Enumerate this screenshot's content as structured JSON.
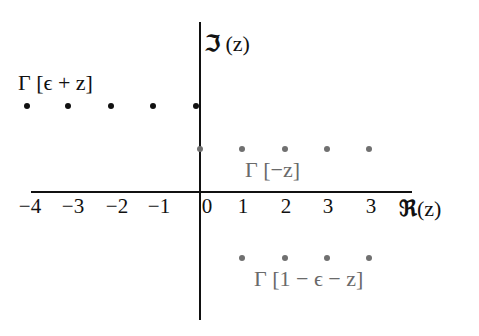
{
  "diagram": {
    "type": "complex-plane-pole-diagram",
    "axes": {
      "real_label_symbol": "ℜ",
      "real_label_arg": "(z)",
      "imag_label_symbol": "ℑ",
      "imag_label_arg": "(z)"
    },
    "ticks": {
      "negative": [
        "−4",
        "−3",
        "−2",
        "−1"
      ],
      "zero": "0",
      "positive": [
        "1",
        "2",
        "3",
        "3"
      ]
    },
    "series": [
      {
        "name": "Γ [ϵ + z]",
        "color": "#111111",
        "row": "top",
        "points_x": [
          -4,
          -3,
          -2,
          -1,
          0
        ]
      },
      {
        "name": "Γ [−z]",
        "color": "#707070",
        "row": "middle",
        "points_x": [
          0,
          1,
          2,
          3,
          4
        ]
      },
      {
        "name": "Γ [1 − ϵ − z]",
        "color": "#707070",
        "row": "bottom",
        "points_x": [
          1,
          2,
          3,
          4
        ]
      }
    ],
    "labels": {
      "gamma_eps_plus_z": "Γ [ϵ + z]",
      "gamma_minus_z": "Γ [−z]",
      "gamma_one_minus_eps_minus_z": "Γ [1 − ϵ − z]"
    }
  },
  "colors": {
    "axis": "#111111",
    "black_series": "#111111",
    "gray_series": "#707070",
    "gray_text": "#6a6a6a"
  }
}
